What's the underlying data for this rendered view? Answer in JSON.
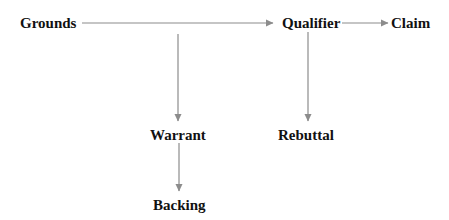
{
  "diagram": {
    "nodes": {
      "grounds": "Grounds",
      "qualifier": "Qualifier",
      "claim": "Claim",
      "warrant": "Warrant",
      "rebuttal": "Rebuttal",
      "backing": "Backing"
    },
    "edges": [
      {
        "from": "Grounds",
        "to": "Qualifier"
      },
      {
        "from": "Qualifier",
        "to": "Claim"
      },
      {
        "from": "Grounds-line",
        "to": "Warrant"
      },
      {
        "from": "Qualifier",
        "to": "Rebuttal"
      },
      {
        "from": "Warrant",
        "to": "Backing"
      }
    ],
    "colors": {
      "arrow": "#8c8c8c",
      "text": "#111111",
      "background": "#ffffff"
    }
  }
}
